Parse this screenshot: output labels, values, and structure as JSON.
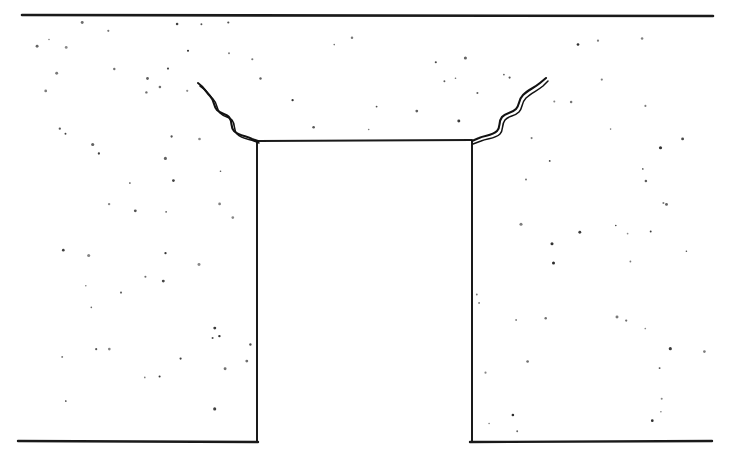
{
  "figure": {
    "kind": "technical-line-drawing",
    "caption": "",
    "title": "",
    "background_color": "#ffffff",
    "ink_color": "#1a1a1a",
    "stipple_color": "#2b2b2b",
    "labels": [],
    "annotations": [],
    "dimensions": {
      "width": 737,
      "height": 464
    }
  },
  "geometry": {
    "ground_line": {
      "x1": 22,
      "y1": 15,
      "x2": 713,
      "y2": 16
    },
    "left_base_line": {
      "x1": 18,
      "y1": 441,
      "x2": 258,
      "y2": 442
    },
    "right_base_line": {
      "x1": 470,
      "y1": 442,
      "x2": 712,
      "y2": 441
    },
    "trench": {
      "left_wall_x": 257,
      "right_wall_x": 472,
      "top_y": 141,
      "bottom_y": 442,
      "top_edge": {
        "x1": 258,
        "y1": 141,
        "x2": 472,
        "y2": 140
      }
    },
    "left_crack": {
      "tip": {
        "x": 198,
        "y": 83
      },
      "root": {
        "x": 258,
        "y": 141
      },
      "path_a": "M 198,83 C 204,87 206,92 210,96 C 215,101 213,106 217,110 C 222,115 226,113 229,117 C 233,122 230,127 234,131 C 239,136 247,136 252,139 L 258,141",
      "path_b": "M 200,86 C 207,90 209,95 213,99 C 218,104 216,109 220,113 C 225,118 229,116 232,120 C 236,125 233,130 237,134 C 242,139 249,139 254,141 L 259,143"
    },
    "right_crack": {
      "tip": {
        "x": 546,
        "y": 78
      },
      "root": {
        "x": 472,
        "y": 141
      },
      "path_a": "M 472,141 L 479,138 C 485,135 492,136 497,131 C 501,127 498,122 502,117 C 506,112 511,114 516,109 C 520,105 518,100 523,95 C 528,90 534,88 540,83 L 546,78",
      "path_b": "M 473,144 L 481,141 C 488,138 495,139 500,134 C 504,130 501,125 505,120 C 509,115 514,117 519,112 C 523,108 521,103 526,98 C 531,93 537,91 543,86 L 548,81"
    },
    "stipple_regions": [
      {
        "name": "upper-soil-band",
        "x": 14,
        "y": 22,
        "width": 700,
        "height": 118
      },
      {
        "name": "left-soil-block",
        "x": 12,
        "y": 140,
        "width": 244,
        "height": 300
      },
      {
        "name": "right-soil-block",
        "x": 474,
        "y": 140,
        "width": 238,
        "height": 300
      }
    ]
  }
}
